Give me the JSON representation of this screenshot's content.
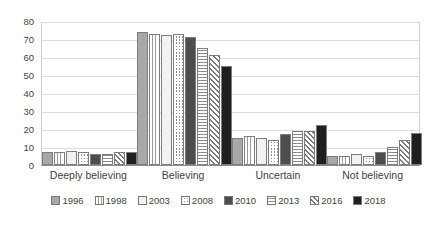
{
  "chart_data": {
    "type": "bar",
    "title": "",
    "subtitle": "",
    "xlabel": "",
    "ylabel": "",
    "ylim": [
      0,
      80
    ],
    "yticks": [
      "0",
      "10",
      "20",
      "30",
      "40",
      "50",
      "60",
      "70",
      "80"
    ],
    "grid": true,
    "legend_position": "bottom",
    "categories": [
      "Deeply believing",
      "Believing",
      "Uncertain",
      "Not believing"
    ],
    "series": [
      {
        "name": "1996",
        "pattern": "solid-gray",
        "color": "#a8a8a8",
        "values": [
          7,
          74,
          15,
          5
        ]
      },
      {
        "name": "1998",
        "pattern": "vertical-lines",
        "color": "#9a9a9a",
        "values": [
          7,
          73,
          16,
          5
        ]
      },
      {
        "name": "2003",
        "pattern": "white",
        "color": "#f2f2f2",
        "values": [
          8,
          72,
          15,
          6
        ]
      },
      {
        "name": "2008",
        "pattern": "checkered",
        "color": "#8f8f8f",
        "values": [
          7,
          73,
          14,
          5
        ]
      },
      {
        "name": "2010",
        "pattern": "solid-dark-gray",
        "color": "#4d4d4d",
        "values": [
          6,
          71,
          17,
          7
        ]
      },
      {
        "name": "2013",
        "pattern": "horizontal-lines",
        "color": "#8a8a8a",
        "values": [
          6,
          65,
          19,
          10
        ]
      },
      {
        "name": "2016",
        "pattern": "diagonal-stripes",
        "color": "#7a7a7a",
        "values": [
          7,
          61,
          19,
          14
        ]
      },
      {
        "name": "2018",
        "pattern": "solid-black",
        "color": "#1f1f1f",
        "values": [
          7,
          55,
          22,
          18
        ]
      }
    ]
  }
}
